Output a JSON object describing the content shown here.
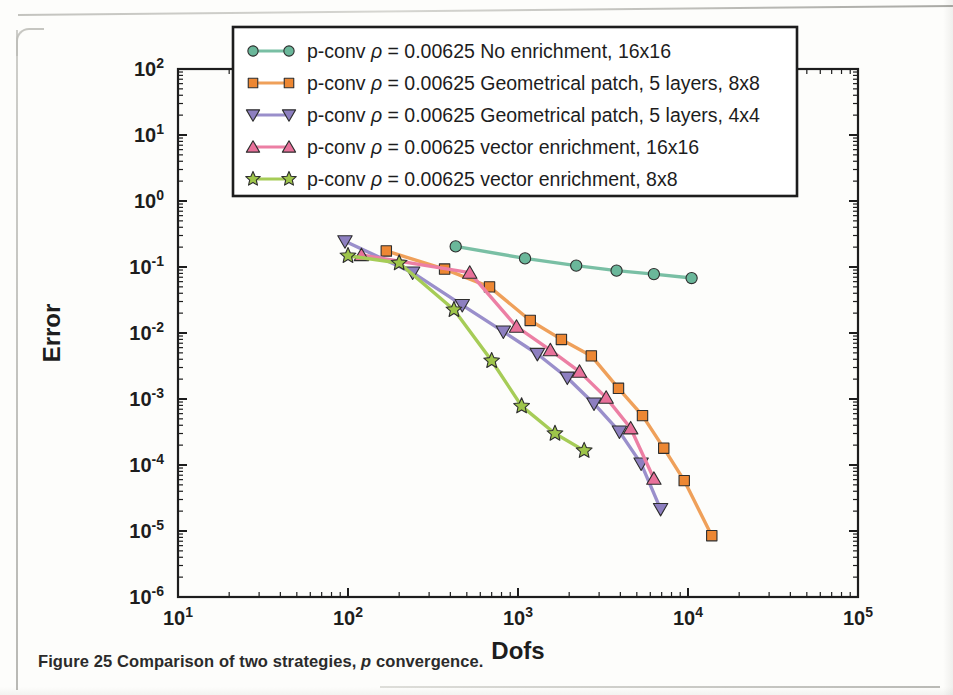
{
  "figure": {
    "caption_prefix": "Figure 25 Comparison of two strategies,",
    "caption_italic": "p",
    "caption_suffix": "convergence."
  },
  "axes": {
    "xlabel": "Dofs",
    "ylabel": "Error",
    "x_ticks": [
      "10",
      "10",
      "10",
      "10",
      "10"
    ],
    "x_tick_exponents": [
      "1",
      "2",
      "3",
      "4",
      "5"
    ],
    "y_ticks": [
      "10",
      "10",
      "10",
      "10",
      "10",
      "10",
      "10",
      "10",
      "10"
    ],
    "y_tick_exponents": [
      "2",
      "1",
      "0",
      "-1",
      "-2",
      "-3",
      "-4",
      "-5",
      "-6"
    ]
  },
  "legend": {
    "entries": [
      {
        "label_prefix": "p-conv",
        "rho": "ρ = 0.00625",
        "label_suffix": "No enrichment, 16x16",
        "marker": "circle",
        "color": "#6ab79a",
        "line_color": "#79bfa4"
      },
      {
        "label_prefix": "p-conv",
        "rho": "ρ = 0.00625",
        "label_suffix": "Geometrical patch, 5 layers, 8x8",
        "marker": "square",
        "color": "#ed8733",
        "line_color": "#efa05a"
      },
      {
        "label_prefix": "p-conv",
        "rho": "ρ = 0.00625",
        "label_suffix": "Geometrical patch, 5 layers, 4x4",
        "marker": "triangle-down",
        "color": "#8d7fc0",
        "line_color": "#9a8fcb"
      },
      {
        "label_prefix": "p-conv",
        "rho": "ρ = 0.00625",
        "label_suffix": "vector enrichment, 16x16",
        "marker": "triangle-up",
        "color": "#e8719a",
        "line_color": "#ec7fa4"
      },
      {
        "label_prefix": "p-conv",
        "rho": "ρ = 0.00625",
        "label_suffix": "vector enrichment, 8x8",
        "marker": "star",
        "color": "#9ec54a",
        "line_color": "#a6cc57"
      }
    ]
  },
  "chart_data": {
    "type": "line",
    "title": "",
    "xlabel": "Dofs",
    "ylabel": "Error",
    "xscale": "log",
    "yscale": "log",
    "xlim": [
      10,
      100000
    ],
    "ylim": [
      1e-06,
      100
    ],
    "grid": false,
    "legend_position": "top-center",
    "series": [
      {
        "name": "p-conv ρ = 0.00625 No enrichment, 16x16",
        "marker": "circle",
        "color": "#6ab79a",
        "line_color": "#79bfa4",
        "x": [
          430,
          1100,
          2200,
          3800,
          6300,
          10500
        ],
        "y": [
          0.205,
          0.135,
          0.105,
          0.088,
          0.078,
          0.068
        ]
      },
      {
        "name": "p-conv ρ = 0.00625 Geometrical patch, 5 layers, 8x8",
        "marker": "square",
        "color": "#ed8733",
        "line_color": "#efa05a",
        "x": [
          168,
          370,
          680,
          1180,
          1800,
          2700,
          3900,
          5400,
          7200,
          9500,
          13800
        ],
        "y": [
          0.175,
          0.093,
          0.05,
          0.0155,
          0.008,
          0.0045,
          0.00145,
          0.00056,
          0.00018,
          5.8e-05,
          8.5e-06
        ]
      },
      {
        "name": "p-conv ρ = 0.00625 Geometrical patch, 5 layers, 4x4",
        "marker": "triangle-down",
        "color": "#8d7fc0",
        "line_color": "#9a8fcb",
        "x": [
          96,
          240,
          470,
          820,
          1300,
          1950,
          2800,
          3950,
          5300,
          6900
        ],
        "y": [
          0.245,
          0.082,
          0.0265,
          0.0105,
          0.0048,
          0.0021,
          0.00085,
          0.00032,
          0.000105,
          2.15e-05
        ]
      },
      {
        "name": "p-conv ρ = 0.00625 vector enrichment, 16x16",
        "marker": "triangle-up",
        "color": "#e8719a",
        "line_color": "#ec7fa4",
        "x": [
          120,
          520,
          980,
          1550,
          2300,
          3300,
          4600,
          6300
        ],
        "y": [
          0.152,
          0.082,
          0.0125,
          0.0055,
          0.0026,
          0.00105,
          0.00036,
          6.2e-05
        ]
      },
      {
        "name": "p-conv ρ = 0.00625 vector enrichment, 8x8",
        "marker": "star",
        "color": "#9ec54a",
        "line_color": "#a6cc57",
        "x": [
          100,
          200,
          420,
          700,
          1050,
          1650,
          2450
        ],
        "y": [
          0.148,
          0.115,
          0.0225,
          0.0038,
          0.00078,
          0.0003,
          0.000165
        ]
      }
    ]
  }
}
